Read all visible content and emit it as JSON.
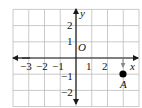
{
  "figure": {
    "type": "coordinate-plane",
    "grid": {
      "x_min": -4,
      "x_max": 4,
      "y_min": -3,
      "y_max": 3,
      "origin_px": [
        76,
        58
      ],
      "unit_x_px": 15.75,
      "unit_y_px": 16.2,
      "grid_color": "#bdbdbd",
      "axis_color": "#1a1a1a"
    },
    "axes": {
      "x_label": "x",
      "y_label": "y",
      "origin_label": "O"
    },
    "x_ticks": [
      {
        "value": -3,
        "label": "−3"
      },
      {
        "value": -2,
        "label": "−2"
      },
      {
        "value": -1,
        "label": "−1"
      },
      {
        "value": 1,
        "label": "1"
      },
      {
        "value": 2,
        "label": "2"
      }
    ],
    "y_ticks": [
      {
        "value": 2,
        "label": "2"
      },
      {
        "value": 1,
        "label": "1"
      },
      {
        "value": -1,
        "label": "−1"
      },
      {
        "value": -2,
        "label": "−2"
      }
    ],
    "points": [
      {
        "name": "A",
        "x": 3,
        "y": -1,
        "color": "#000000"
      }
    ],
    "annotation_arrow": {
      "from": [
        3,
        0
      ],
      "to": [
        3,
        -0.6
      ],
      "color": "#8a8a8a"
    }
  }
}
